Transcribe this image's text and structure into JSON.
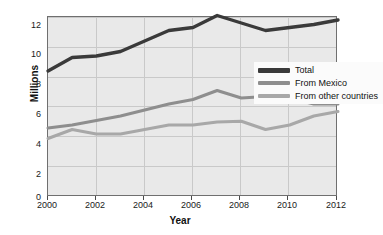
{
  "chart_data": {
    "type": "line",
    "title": "",
    "xlabel": "Year",
    "ylabel": "Millions",
    "xlim": [
      2000,
      2012
    ],
    "ylim": [
      0,
      12
    ],
    "grid": true,
    "legend_position": "inside-right-upper",
    "x": [
      2000,
      2001,
      2002,
      2003,
      2004,
      2005,
      2006,
      2007,
      2008,
      2009,
      2010,
      2011,
      2012
    ],
    "xticks": [
      "2000",
      "2002",
      "2004",
      "2006",
      "2008",
      "2010",
      "2012"
    ],
    "yticks": [
      "0",
      "2",
      "4",
      "6",
      "8",
      "10",
      "12"
    ],
    "series": [
      {
        "name": "Total",
        "color": "#3a3a3a",
        "values": [
          8.4,
          9.3,
          9.4,
          9.7,
          10.4,
          11.1,
          11.3,
          12.1,
          11.6,
          11.1,
          11.3,
          11.5,
          11.8
        ]
      },
      {
        "name": "From Mexico",
        "color": "#8e8e8e",
        "values": [
          4.6,
          4.8,
          5.1,
          5.4,
          5.8,
          6.2,
          6.5,
          7.1,
          6.6,
          6.7,
          6.6,
          6.2,
          6.2
        ]
      },
      {
        "name": "From other countries",
        "color": "#a8a8a8",
        "values": [
          3.9,
          4.5,
          4.2,
          4.2,
          4.5,
          4.8,
          4.8,
          5.0,
          5.05,
          4.5,
          4.8,
          5.4,
          5.7
        ]
      }
    ]
  },
  "legend": {
    "items": [
      {
        "label": "Total"
      },
      {
        "label": "From Mexico"
      },
      {
        "label": "From other countries"
      }
    ]
  }
}
